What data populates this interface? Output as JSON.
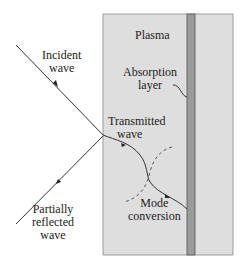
{
  "colors": {
    "plasma": "#dedede",
    "absorption_layer": "#9a9a9a",
    "lines": "#333333",
    "text": "#222222"
  },
  "labels": {
    "plasma": "Plasma",
    "incident": [
      "Incident",
      "wave"
    ],
    "reflected": [
      "Partially",
      "reflected",
      "wave"
    ],
    "transmitted": [
      "Transmitted",
      "wave"
    ],
    "absorption": [
      "Absorption",
      "layer"
    ],
    "mode_conversion": [
      "Mode",
      "conversion"
    ]
  }
}
